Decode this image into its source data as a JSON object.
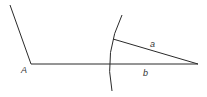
{
  "diagram": {
    "type": "geometric-construction",
    "colors": {
      "stroke": "#2a2a2a",
      "background": "#ffffff",
      "label": "#333333"
    },
    "points": {
      "A": {
        "label": "A",
        "x": 31,
        "y": 64
      }
    },
    "segments": [
      {
        "name": "ray-from-A",
        "x1": 10,
        "y1": 5,
        "x2": 31,
        "y2": 64
      },
      {
        "name": "side-b",
        "label": "b",
        "x1": 31,
        "y1": 64,
        "x2": 198,
        "y2": 64
      },
      {
        "name": "side-a",
        "label": "a",
        "x1": 113,
        "y1": 39,
        "x2": 198,
        "y2": 64
      }
    ],
    "arc": {
      "name": "compass-arc",
      "start": [
        122,
        15
      ],
      "through": [
        109,
        64
      ],
      "end": [
        112,
        91
      ]
    },
    "labels": {
      "A": "A",
      "a": "a",
      "b": "b"
    }
  }
}
